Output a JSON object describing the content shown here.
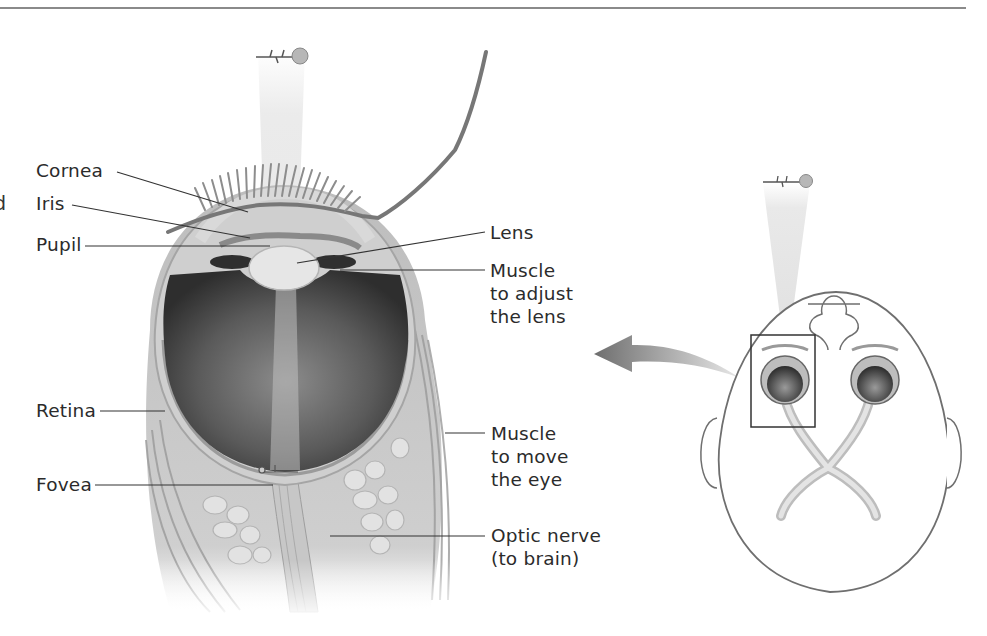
{
  "figure": {
    "edge_text_fragment": "d",
    "labels": {
      "cornea": "Cornea",
      "iris": "Iris",
      "pupil": "Pupil",
      "lens": "Lens",
      "ciliary_muscle": "Muscle\nto adjust\nthe lens",
      "retina": "Retina",
      "eye_muscle": "Muscle\nto move\nthe eye",
      "fovea": "Fovea",
      "optic_nerve": "Optic nerve\n(to brain)"
    },
    "icons": {
      "flower": "rose-flower-icon",
      "arrow": "curved-arrow-left-icon"
    },
    "colors": {
      "ink": "#2b2b2b",
      "tissue_light": "#d8d8d8",
      "tissue_mid": "#a9a9a9",
      "eyeball_dark": "#3a3a3a",
      "light_beam": "#e6e6e6",
      "rule": "#8a8a8a"
    }
  }
}
